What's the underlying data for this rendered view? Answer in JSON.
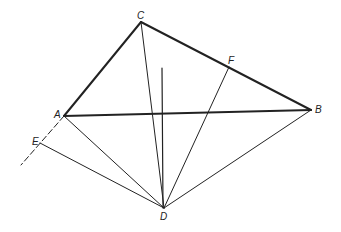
{
  "diagram": {
    "points": {
      "A": {
        "label": "A",
        "x": 64,
        "y": 116
      },
      "B": {
        "label": "B",
        "x": 311,
        "y": 110
      },
      "C": {
        "label": "C",
        "x": 141,
        "y": 22
      },
      "D": {
        "label": "D",
        "x": 164,
        "y": 208
      },
      "E": {
        "label": "E",
        "x": 40,
        "y": 143
      },
      "F": {
        "label": "F",
        "x": 229,
        "y": 67
      }
    },
    "colors": {
      "line": "#222222",
      "background": "#ffffff"
    }
  }
}
